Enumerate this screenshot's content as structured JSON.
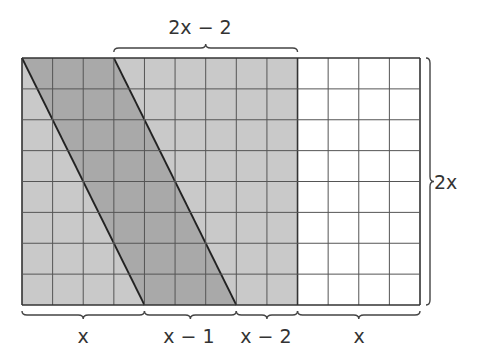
{
  "diagram": {
    "type": "area-model-grid",
    "grid": {
      "columns": 13,
      "rows": 8,
      "shaded_columns": 9,
      "white_columns": 4,
      "shade_color": "#c9c9c9",
      "parallelogram_color": "#a9a9a9",
      "line_color": "#555555"
    },
    "parallelogram": {
      "top_start_col": 0,
      "top_end_col": 3,
      "bottom_start_col": 4,
      "bottom_end_col": 7
    },
    "labels": {
      "top": "2x − 2",
      "right": "2x",
      "bottom": [
        "x",
        "x − 1",
        "x − 2",
        "x"
      ]
    }
  }
}
